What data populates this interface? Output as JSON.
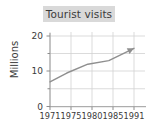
{
  "chart_data": {
    "type": "line",
    "title": "Tourist visits",
    "xlabel": "",
    "ylabel": "Millions",
    "x": [
      1971,
      1975,
      1980,
      1985,
      1991
    ],
    "tick_labels_x": [
      "1971",
      "1975",
      "1980",
      "1985",
      "1991"
    ],
    "tick_labels_y": [
      "0",
      "10",
      "20"
    ],
    "values": [
      7,
      9.5,
      12,
      13,
      16.5
    ],
    "series": [
      {
        "name": "Tourist visits",
        "values": [
          7,
          9.5,
          12,
          13,
          16.5
        ]
      }
    ],
    "xlim": [
      1971,
      1991
    ],
    "ylim": [
      0,
      20
    ],
    "yticks": [
      0,
      10,
      20
    ],
    "grid": true,
    "legend": false,
    "legend_position": "none",
    "line_color": "#8f8f8f",
    "title_background": "#d9d9d9",
    "text_color": "#3b3b3b",
    "grid_color": "#d2d2d2",
    "axis_color": "#9a9a9a",
    "end_marker": "arrow"
  },
  "labels": {
    "title": "Tourist visits",
    "ylabel": "Millions",
    "y_ticks": [
      "20",
      "10",
      "0"
    ],
    "x_ticks": [
      "1971",
      "1975",
      "1980",
      "1985",
      "1991"
    ]
  }
}
